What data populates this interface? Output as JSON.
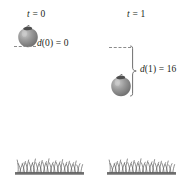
{
  "figure": {
    "title_present": false,
    "background_color": "#ffffff",
    "ink_color": "#231f20",
    "object_color": "#8a8a8a",
    "grass_color": "#6e6e6e",
    "dash_color": "#8c8c8c"
  },
  "columns": [
    {
      "time_label": "t = 0",
      "time_var": "t",
      "time_eq": " = 0",
      "distance_label": "d(0) = 0",
      "distance_var": "d",
      "distance_rest": "(0) = 0",
      "object": "apple",
      "object_icon": "apple-icon",
      "ground": "grass-patch"
    },
    {
      "time_label": "t = 1",
      "time_var": "t",
      "time_eq": " = 1",
      "distance_label": "d(1) = 16",
      "distance_var": "d",
      "distance_rest": "(1) = 16",
      "object": "apple",
      "object_icon": "apple-icon",
      "ground": "grass-patch"
    }
  ],
  "annotations": {
    "brace_name": "distance-brace",
    "dash_t0_name": "reference-dash-t0",
    "dash_t1_name": "reference-dash-t1"
  }
}
